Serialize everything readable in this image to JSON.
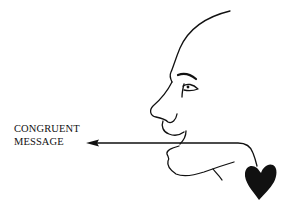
{
  "diagram": {
    "label_lines": [
      "CONGRUENT",
      "MESSAGE"
    ],
    "elements": [
      "face-profile",
      "arrow",
      "heart"
    ],
    "colors": {
      "stroke": "#111111",
      "heart": "#111111",
      "background": "#ffffff"
    }
  }
}
